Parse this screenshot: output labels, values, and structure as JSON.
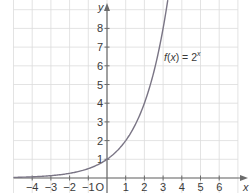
{
  "chart_data": {
    "type": "line",
    "title": "",
    "xlabel": "x",
    "ylabel": "y",
    "origin_label": "O",
    "xlim": [
      -5,
      7
    ],
    "ylim": [
      0,
      9.5
    ],
    "grid": true,
    "x_ticks": [
      -4,
      -3,
      -2,
      -1,
      1,
      2,
      3,
      4,
      5,
      6
    ],
    "x_tick_labels": [
      "−4",
      "−3",
      "−2",
      "−1",
      "1",
      "2",
      "3",
      "4",
      "5",
      "6"
    ],
    "y_ticks": [
      1,
      2,
      3,
      4,
      5,
      6,
      7,
      8
    ],
    "y_tick_labels": [
      "1",
      "2",
      "3",
      "4",
      "5",
      "6",
      "7",
      "8"
    ],
    "series": [
      {
        "name": "f(x) = 2^x",
        "function": "2^x",
        "x": [
          -5,
          -4,
          -3,
          -2,
          -1,
          0,
          1,
          2,
          3,
          3.25
        ],
        "values": [
          0.03125,
          0.0625,
          0.125,
          0.25,
          0.5,
          1,
          2,
          4,
          8,
          9.51
        ],
        "color": "#7a7585"
      }
    ],
    "annotations": [
      {
        "text": "f(x) = 2",
        "superscript": "x",
        "x": 3.1,
        "y": 6.5
      }
    ]
  }
}
